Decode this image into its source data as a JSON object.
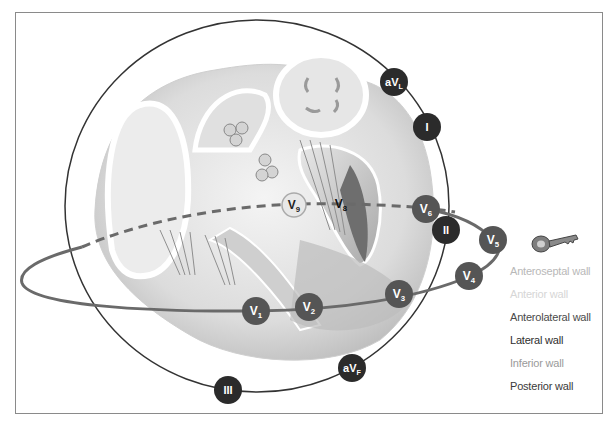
{
  "figure": {
    "type": "ECG lead placement diagram over heart cross-section",
    "frontal_plane_leads": [
      {
        "id": "aVL",
        "base": "aV",
        "sub": "L",
        "x": 394,
        "y": 82
      },
      {
        "id": "I",
        "base": "I",
        "sub": "",
        "x": 427,
        "y": 127
      },
      {
        "id": "II",
        "base": "II",
        "sub": "",
        "x": 446,
        "y": 230
      },
      {
        "id": "aVF",
        "base": "aV",
        "sub": "F",
        "x": 352,
        "y": 368
      },
      {
        "id": "III",
        "base": "III",
        "sub": "",
        "x": 228,
        "y": 390
      }
    ],
    "precordial_leads": [
      {
        "id": "V1",
        "base": "V",
        "sub": "1",
        "x": 256,
        "y": 311
      },
      {
        "id": "V2",
        "base": "V",
        "sub": "2",
        "x": 309,
        "y": 307
      },
      {
        "id": "V3",
        "base": "V",
        "sub": "3",
        "x": 399,
        "y": 294
      },
      {
        "id": "V4",
        "base": "V",
        "sub": "4",
        "x": 469,
        "y": 276
      },
      {
        "id": "V5",
        "base": "V",
        "sub": "5",
        "x": 493,
        "y": 240
      },
      {
        "id": "V6",
        "base": "V",
        "sub": "6",
        "x": 426,
        "y": 209
      }
    ],
    "posterior_leads": [
      {
        "id": "V8",
        "base": "V",
        "sub": "8",
        "x": 341,
        "y": 204
      },
      {
        "id": "V9",
        "base": "V",
        "sub": "9",
        "x": 294,
        "y": 205
      }
    ]
  },
  "legend": {
    "icon": "key-icon",
    "items": [
      {
        "label": "Anteroseptal wall",
        "color": "#b8b8b8"
      },
      {
        "label": "Anterior wall",
        "color": "#d6d6d6"
      },
      {
        "label": "Anterolateral wall",
        "color": "#4a4a4a"
      },
      {
        "label": "Lateral wall",
        "color": "#2e2e2e"
      },
      {
        "label": "Inferior wall",
        "color": "#9a9a9a"
      },
      {
        "label": "Posterior wall",
        "color": "#3a3a3a"
      }
    ]
  },
  "colors": {
    "lead_dark": "#2b2b2b",
    "lead_medium": "#555555",
    "frame": "#8a8a8a",
    "circle_stroke": "#333333",
    "ellipse_stroke": "#6a6a6a"
  }
}
